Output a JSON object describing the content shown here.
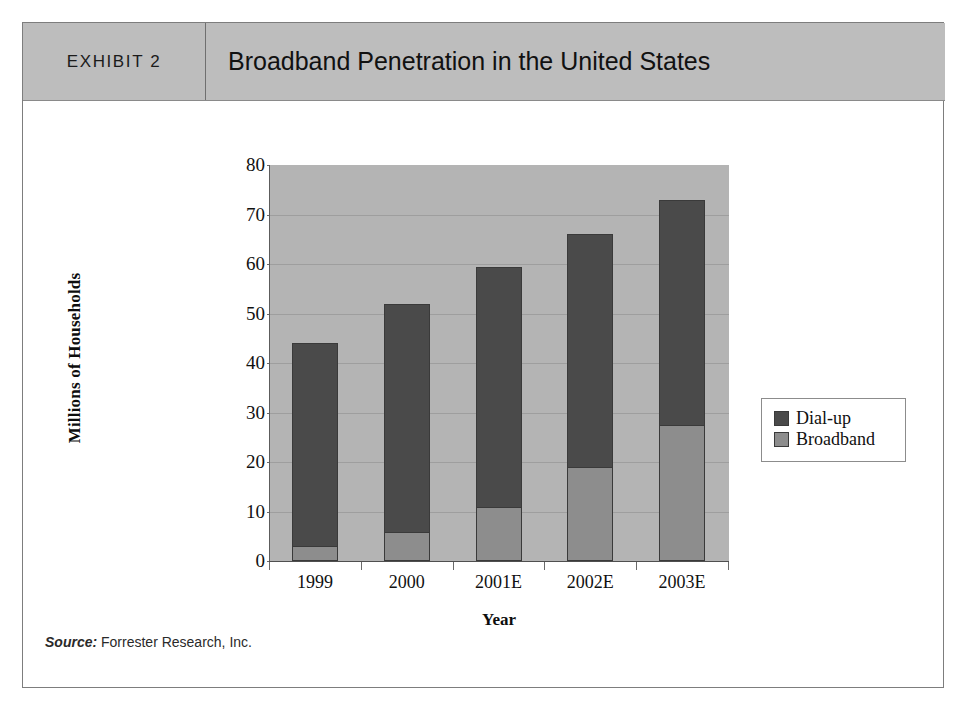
{
  "exhibit": {
    "label": "EXHIBIT 2",
    "title": "Broadband Penetration in the United States"
  },
  "source": {
    "label": "Source:",
    "text": " Forrester Research, Inc."
  },
  "colors": {
    "header_band": "#bdbdbd",
    "plot_background": "#b4b4b4",
    "dial_up": "#4a4a4a",
    "broadband": "#8d8d8d",
    "frame_border": "#7d7d7d"
  },
  "chart_data": {
    "type": "bar",
    "stacked": true,
    "title": "Broadband Penetration in the United States",
    "xlabel": "Year",
    "ylabel": "Millions of Households",
    "categories": [
      "1999",
      "2000",
      "2001E",
      "2002E",
      "2003E"
    ],
    "series": [
      {
        "name": "Broadband",
        "color": "#8d8d8d",
        "values": [
          3,
          5.8,
          11,
          19,
          27.5
        ]
      },
      {
        "name": "Dial-up",
        "color": "#4a4a4a",
        "values": [
          41,
          46.2,
          48.5,
          47,
          45.5
        ]
      }
    ],
    "stack_order_bottom_to_top": [
      "Broadband",
      "Dial-up"
    ],
    "totals": [
      44,
      52,
      59.5,
      66,
      73
    ],
    "ylim": [
      0,
      80
    ],
    "yticks": [
      0,
      10,
      20,
      30,
      40,
      50,
      60,
      70,
      80
    ],
    "ytick_labels": [
      "0",
      "10",
      "20",
      "30",
      "40",
      "50",
      "60",
      "70",
      "80"
    ],
    "grid": true,
    "legend_position": "right",
    "legend_entries": [
      "Dial-up",
      "Broadband"
    ]
  }
}
